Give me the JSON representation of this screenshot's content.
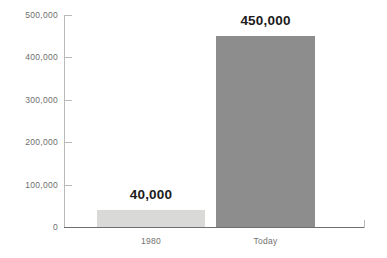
{
  "chart_data": {
    "type": "bar",
    "title": "",
    "subtitle": "",
    "xlabel": "",
    "ylabel": "",
    "categories": [
      "1980",
      "Today"
    ],
    "values": [
      40000,
      450000
    ],
    "data_labels": [
      "40,000",
      "450,000"
    ],
    "series": [
      {
        "name": "",
        "values": [
          40000,
          450000
        ]
      }
    ],
    "ylim": [
      0,
      500000
    ],
    "y_ticks": [
      0,
      100000,
      200000,
      300000,
      400000,
      500000
    ],
    "y_tick_labels": [
      "0",
      "100,000",
      "200,000",
      "300,000",
      "400,000",
      "500,000"
    ],
    "grid": false,
    "legend": false,
    "legend_position": "none",
    "bar_colors": [
      "#d9dad8",
      "#8d8d8d"
    ],
    "axis_color": "#b9b9b9",
    "baseline_color": "#6f6f6f",
    "tick_label_color": "#6e6e6e",
    "category_label_color": "#717171",
    "data_label_color": "#1c1c1c",
    "background": "#ffffff"
  }
}
